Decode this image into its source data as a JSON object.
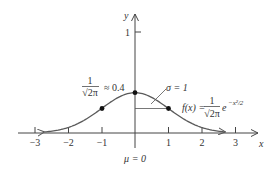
{
  "chart_data": {
    "type": "line",
    "title": "",
    "xlabel": "x",
    "ylabel": "y",
    "xlim": [
      -3.5,
      3.6
    ],
    "ylim": [
      0,
      1.15
    ],
    "grid": false,
    "x_ticks": [
      -3,
      -2,
      -1,
      1,
      2,
      3
    ],
    "x_tick_labels": [
      "−3",
      "−2",
      "−1",
      "1",
      "2",
      "3"
    ],
    "y_ticks": [
      1
    ],
    "y_tick_labels": [
      "1"
    ],
    "series": [
      {
        "name": "f(x) = (1/√(2π)) e^(−x²/2)",
        "function": "standard normal density",
        "x": [
          -2.7,
          -2.5,
          -2,
          -1.5,
          -1,
          -0.5,
          0,
          0.5,
          1,
          1.5,
          2,
          2.5,
          2.7
        ],
        "values": [
          0.01,
          0.018,
          0.054,
          0.13,
          0.242,
          0.352,
          0.399,
          0.352,
          0.242,
          0.13,
          0.054,
          0.018,
          0.01
        ],
        "color": "#555555"
      }
    ],
    "marked_points": [
      {
        "x": -1,
        "y": 0.242
      },
      {
        "x": 0,
        "y": 0.399
      },
      {
        "x": 1,
        "y": 0.242
      }
    ],
    "annotations": {
      "peak_label_num": "1",
      "peak_label_den": "√2π",
      "peak_label_approx": "≈ 0.4",
      "sigma_label": "σ = 1",
      "mu_label": "μ = 0",
      "function_label_lhs": "f(x) =",
      "function_label_num": "1",
      "function_label_den": "√2π",
      "function_label_base": "e",
      "function_label_exp": "−x²/2"
    }
  }
}
